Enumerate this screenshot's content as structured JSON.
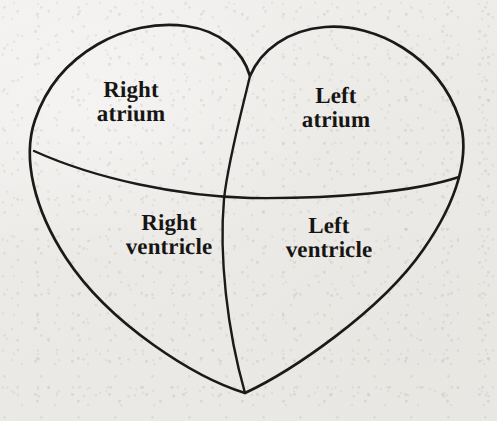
{
  "figure": {
    "style": "line drawing on aged paper",
    "background_color": "#eeedeb",
    "line_color": "#1a1a1a",
    "text_color": "#161513"
  },
  "labels": {
    "right_atrium": {
      "line1": "Right",
      "line2": "atrium"
    },
    "left_atrium": {
      "line1": "Left",
      "line2": "atrium"
    },
    "right_ventricle": {
      "line1": "Right",
      "line2": "ventricle"
    },
    "left_ventricle": {
      "line1": "Left",
      "line2": "ventricle"
    }
  },
  "geometry": {
    "heart_outline_path": "M 250 76 C 243 52 222 31 186 26 C 128 18 58 52 35 120 C 22 158 34 209 66 258 C 110 325 196 378 245 393 C 290 372 380 312 423 250 C 458 200 471 154 459 118 C 438 56 375 23 325 27 C 288 30 261 50 250 76 Z",
    "atrioventricular_divider_path": "M 34 151 C 96 179 178 196 250 198 C 334 199 414 192 459 177",
    "interventricular_septum_path": "M 250 76 C 240 118 228 162 224 199 C 219 256 227 330 245 393",
    "bottom_apex": [
      245,
      393
    ],
    "top_cleft": [
      250,
      76
    ],
    "crossing_point": [
      225,
      198
    ]
  }
}
